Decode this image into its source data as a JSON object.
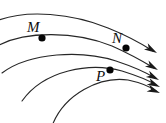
{
  "figure": {
    "width": 166,
    "height": 123,
    "background_color": "#ffffff",
    "line_color": "#262626",
    "marker_color": "#050505",
    "label_color": "#0d0d0d"
  },
  "labels": {
    "m": "M",
    "n": "N",
    "p": "P"
  },
  "chart_data": {
    "type": "line",
    "xlabel": "",
    "ylabel": "",
    "grid": false,
    "legend": "none",
    "xlim": [
      0,
      166
    ],
    "ylim": [
      0,
      123
    ],
    "series": [
      {
        "name": "field-line-1",
        "path": "M -6 22 C 26 8, 74 14, 108 28 C 128 36, 142 44, 153 51",
        "arrow": {
          "x": 157,
          "y": 53,
          "angle": 31
        }
      },
      {
        "name": "field-line-2",
        "path": "M -6 48 C 24 29, 78 32, 112 46 C 130 54, 144 62, 154 68",
        "arrow": {
          "x": 158,
          "y": 70,
          "angle": 30
        }
      },
      {
        "name": "field-line-3",
        "path": "M 2 73 C 30 52, 82 50, 116 61 C 134 67, 147 73, 155 78",
        "arrow": {
          "x": 159,
          "y": 80,
          "angle": 28
        }
      },
      {
        "name": "field-line-4",
        "path": "M 22 101 C 44 70, 90 62, 122 71 C 138 76, 150 81, 156 85",
        "arrow": {
          "x": 160,
          "y": 87,
          "angle": 25
        }
      },
      {
        "name": "field-line-5",
        "path": "M 52 126 C 64 94, 100 76, 128 80 C 142 83, 152 88, 156 91",
        "arrow": {
          "x": 160,
          "y": 93,
          "angle": 22
        }
      }
    ],
    "points": [
      {
        "label": "M",
        "x": 42,
        "y": 38,
        "label_x": 27,
        "label_y": 32
      },
      {
        "label": "N",
        "x": 126,
        "y": 48,
        "label_x": 112,
        "label_y": 43
      },
      {
        "label": "P",
        "x": 110,
        "y": 70,
        "label_x": 96,
        "label_y": 81
      }
    ]
  }
}
